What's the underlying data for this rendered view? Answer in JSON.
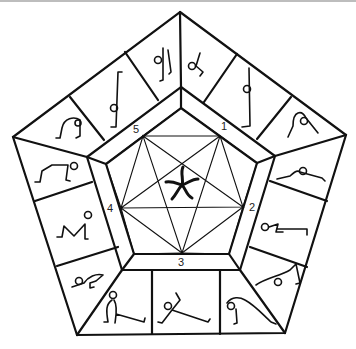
{
  "diagram": {
    "title": "",
    "vertex_labels": [
      {
        "id": "v1",
        "text": "1"
      },
      {
        "id": "v2",
        "text": "2"
      },
      {
        "id": "v3",
        "text": "3"
      },
      {
        "id": "v4",
        "text": "4"
      },
      {
        "id": "v5",
        "text": "5"
      }
    ],
    "center_icon": "starfish-icon",
    "outer_cells": [
      {
        "side": "top-left",
        "pose": "yoga-pose-arch-icon"
      },
      {
        "side": "top-left",
        "pose": "yoga-pose-standing-bar-icon"
      },
      {
        "side": "top-left",
        "pose": "yoga-pose-curled-icon"
      },
      {
        "side": "top-right",
        "pose": "yoga-pose-seated-curl-icon"
      },
      {
        "side": "top-right",
        "pose": "yoga-pose-standing-tall-icon"
      },
      {
        "side": "top-right",
        "pose": "yoga-pose-forward-bend-icon"
      },
      {
        "side": "right",
        "pose": "yoga-pose-lying-icon"
      },
      {
        "side": "right",
        "pose": "yoga-pose-plank-icon"
      },
      {
        "side": "right",
        "pose": "yoga-pose-bridge-icon"
      },
      {
        "side": "bottom",
        "pose": "yoga-pose-backbend-icon"
      },
      {
        "side": "bottom",
        "pose": "yoga-pose-lunge-icon"
      },
      {
        "side": "bottom",
        "pose": "yoga-pose-split-icon"
      },
      {
        "side": "left",
        "pose": "yoga-pose-crouch-icon"
      },
      {
        "side": "left",
        "pose": "yoga-pose-table-icon"
      },
      {
        "side": "left",
        "pose": "yoga-pose-downdog-icon"
      }
    ]
  }
}
